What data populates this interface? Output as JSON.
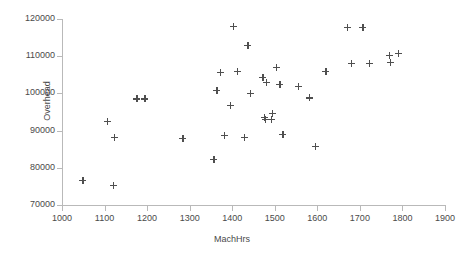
{
  "chart_data": {
    "type": "scatter",
    "title": "",
    "xlabel": "MachHrs",
    "ylabel": "Overhead",
    "xlim": [
      1000,
      1900
    ],
    "ylim": [
      70000,
      120000
    ],
    "xticks": [
      1000,
      1100,
      1200,
      1300,
      1400,
      1500,
      1600,
      1700,
      1800,
      1900
    ],
    "yticks": [
      70000,
      80000,
      90000,
      100000,
      110000,
      120000
    ],
    "xtick_labels": [
      "1000",
      "1100",
      "1200",
      "1300",
      "1400",
      "1500",
      "1600",
      "1700",
      "1800",
      "1900"
    ],
    "ytick_labels": [
      "70000",
      "80000",
      "90000",
      "100000",
      "110000",
      "120000"
    ],
    "grid": false,
    "legend": false,
    "marker": "plus",
    "marker_color": "#4f4f4f",
    "axis_color": "#b9b9b9",
    "points": [
      {
        "x": 1049,
        "y": 76600
      },
      {
        "x": 1106,
        "y": 92400
      },
      {
        "x": 1120,
        "y": 75300
      },
      {
        "x": 1123,
        "y": 88100
      },
      {
        "x": 1176,
        "y": 98500
      },
      {
        "x": 1195,
        "y": 98500
      },
      {
        "x": 1284,
        "y": 87900
      },
      {
        "x": 1357,
        "y": 82200
      },
      {
        "x": 1364,
        "y": 100900
      },
      {
        "x": 1372,
        "y": 105700
      },
      {
        "x": 1381,
        "y": 88700
      },
      {
        "x": 1396,
        "y": 96800
      },
      {
        "x": 1402,
        "y": 118000
      },
      {
        "x": 1412,
        "y": 105900
      },
      {
        "x": 1429,
        "y": 88100
      },
      {
        "x": 1437,
        "y": 113000
      },
      {
        "x": 1443,
        "y": 99900
      },
      {
        "x": 1472,
        "y": 104300
      },
      {
        "x": 1475,
        "y": 93500
      },
      {
        "x": 1478,
        "y": 93000
      },
      {
        "x": 1481,
        "y": 102900
      },
      {
        "x": 1492,
        "y": 93000
      },
      {
        "x": 1495,
        "y": 94600
      },
      {
        "x": 1504,
        "y": 107000
      },
      {
        "x": 1512,
        "y": 102400
      },
      {
        "x": 1519,
        "y": 88900
      },
      {
        "x": 1555,
        "y": 101800
      },
      {
        "x": 1581,
        "y": 98800
      },
      {
        "x": 1596,
        "y": 85700
      },
      {
        "x": 1620,
        "y": 105900
      },
      {
        "x": 1670,
        "y": 117700
      },
      {
        "x": 1681,
        "y": 108100
      },
      {
        "x": 1707,
        "y": 117700
      },
      {
        "x": 1722,
        "y": 108100
      },
      {
        "x": 1769,
        "y": 110300
      },
      {
        "x": 1772,
        "y": 108400
      },
      {
        "x": 1790,
        "y": 110800
      }
    ]
  }
}
